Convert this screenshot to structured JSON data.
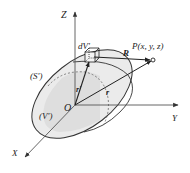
{
  "diagram": {
    "type": "3d-coordinate-volume-diagram",
    "axes": {
      "z_label": "Z",
      "y_label": "Y",
      "x_label": "X",
      "origin_label": "O"
    },
    "regions": {
      "surface_label": "(S')",
      "volume_label": "(V')"
    },
    "element": {
      "volume_element_label": "dV'"
    },
    "vectors": {
      "source_vector_label": "r'",
      "field_vector_label": "r",
      "separation_vector_label": "R"
    },
    "point": {
      "label": "P(x, y, z)"
    },
    "colors": {
      "stroke": "#333333",
      "fill_shade": "#e6e6e6",
      "fill_inner": "#d4d4d4",
      "axis": "#555555"
    }
  }
}
